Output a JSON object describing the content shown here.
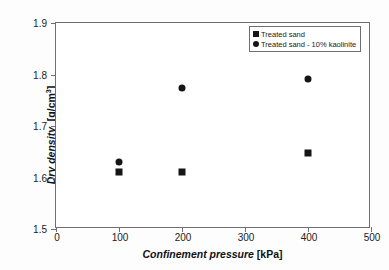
{
  "chart_data": {
    "type": "scatter",
    "title": "",
    "xlabel": "Confinement pressure",
    "xunit": "[kPa]",
    "ylabel": "Dry density",
    "yunit": "[g/cm³]",
    "xlim": [
      0,
      500
    ],
    "ylim": [
      1.5,
      1.9
    ],
    "xticks": [
      0,
      100,
      200,
      300,
      400,
      500
    ],
    "xtick_labels": [
      "0",
      "100",
      "200",
      "300",
      "400",
      "500"
    ],
    "yticks": [
      1.5,
      1.6,
      1.7,
      1.8,
      1.9
    ],
    "ytick_labels": [
      "1.5",
      "1.6",
      "1.7",
      "1.8",
      "1.9"
    ],
    "grid": false,
    "legend_position": "upper-right",
    "marker_color": "#151515",
    "series": [
      {
        "name": "Treated sand",
        "marker": "square",
        "x": [
          100,
          200,
          400
        ],
        "y": [
          1.61,
          1.611,
          1.648
        ]
      },
      {
        "name": "Treated sand - 10% kaolinite",
        "marker": "circle",
        "x": [
          100,
          200,
          400
        ],
        "y": [
          1.631,
          1.773,
          1.792
        ]
      }
    ]
  },
  "legend": {
    "items": [
      {
        "label": "Treated sand",
        "marker": "square-marker"
      },
      {
        "label": "Treated sand - 10% kaolinite",
        "marker": "circle-marker"
      }
    ]
  }
}
